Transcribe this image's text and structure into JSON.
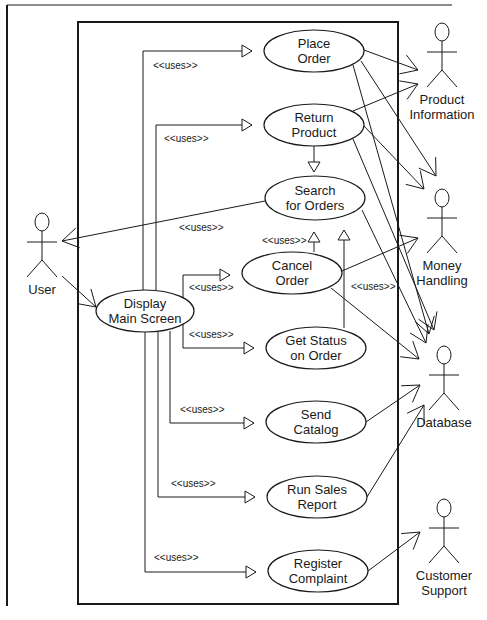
{
  "diagram": {
    "type": "UML use case diagram",
    "frame": {
      "top_line": {
        "x1": 7,
        "y": 5,
        "x2": 452
      },
      "left_line": {
        "x": 7,
        "y1": 5,
        "y2": 606
      }
    },
    "system_boundary": {
      "x": 78,
      "y": 22,
      "w": 320,
      "h": 582
    },
    "colors": {
      "stroke": "#1a1a1a",
      "background": "#ffffff"
    }
  },
  "use_cases": [
    {
      "id": "place_order",
      "lines": [
        "Place",
        "Order"
      ],
      "cx": 314,
      "cy": 51,
      "rx": 50,
      "ry": 21
    },
    {
      "id": "return_product",
      "lines": [
        "Return",
        "Product"
      ],
      "cx": 314,
      "cy": 125,
      "rx": 50,
      "ry": 21
    },
    {
      "id": "search_orders",
      "lines": [
        "Search",
        "for Orders"
      ],
      "cx": 315,
      "cy": 198,
      "rx": 50,
      "ry": 22
    },
    {
      "id": "cancel_order",
      "lines": [
        "Cancel",
        "Order"
      ],
      "cx": 292,
      "cy": 273,
      "rx": 50,
      "ry": 21
    },
    {
      "id": "display_main",
      "lines": [
        "Display",
        "Main Screen"
      ],
      "cx": 145,
      "cy": 311,
      "rx": 49,
      "ry": 21
    },
    {
      "id": "get_status",
      "lines": [
        "Get Status",
        "on Order"
      ],
      "cx": 316,
      "cy": 348,
      "rx": 50,
      "ry": 21
    },
    {
      "id": "send_catalog",
      "lines": [
        "Send",
        "Catalog"
      ],
      "cx": 316,
      "cy": 422,
      "rx": 50,
      "ry": 21
    },
    {
      "id": "run_sales_report",
      "lines": [
        "Run Sales",
        "Report"
      ],
      "cx": 317,
      "cy": 497,
      "rx": 50,
      "ry": 21
    },
    {
      "id": "register_complaint",
      "lines": [
        "Register",
        "Complaint"
      ],
      "cx": 318,
      "cy": 571,
      "rx": 50,
      "ry": 21
    }
  ],
  "actors": [
    {
      "id": "user",
      "lines": [
        "User"
      ],
      "x": 42,
      "head_y": 80,
      "y": 222
    },
    {
      "id": "product_information",
      "lines": [
        "Product",
        "Information"
      ],
      "x": 442,
      "y": 32
    },
    {
      "id": "money_handling",
      "lines": [
        "Money",
        "Handling"
      ],
      "x": 442,
      "y": 198
    },
    {
      "id": "database",
      "lines": [
        "Database"
      ],
      "x": 444,
      "y": 355
    },
    {
      "id": "customer_support",
      "lines": [
        "Customer",
        "Support"
      ],
      "x": 444,
      "y": 508
    }
  ],
  "stereotype_labels": [
    {
      "text": "<<uses>>",
      "x": 153,
      "y": 69
    },
    {
      "text": "<<uses>>",
      "x": 164,
      "y": 142
    },
    {
      "text": "<<uses>>",
      "x": 179,
      "y": 231
    },
    {
      "text": "<<uses>>",
      "x": 262,
      "y": 244
    },
    {
      "text": "<<uses>>",
      "x": 189,
      "y": 291
    },
    {
      "text": "<<uses>>",
      "x": 351,
      "y": 290
    },
    {
      "text": "<<uses>>",
      "x": 189,
      "y": 338
    },
    {
      "text": "<<uses>>",
      "x": 180,
      "y": 413
    },
    {
      "text": "<<uses>>",
      "x": 171,
      "y": 487
    },
    {
      "text": "<<uses>>",
      "x": 154,
      "y": 561
    }
  ],
  "uses_relations": [
    {
      "from": "display_main",
      "to": "place_order",
      "path": [
        [
          143,
          290
        ],
        [
          143,
          51
        ],
        [
          252,
          51
        ]
      ]
    },
    {
      "from": "display_main",
      "to": "return_product",
      "path": [
        [
          156,
          290
        ],
        [
          156,
          125
        ],
        [
          252,
          125
        ]
      ]
    },
    {
      "from": "display_main",
      "to": "cancel_order",
      "path": [
        [
          183,
          300
        ],
        [
          183,
          275
        ],
        [
          230,
          275
        ]
      ]
    },
    {
      "from": "display_main",
      "to": "get_status",
      "path": [
        [
          183,
          320
        ],
        [
          183,
          348
        ],
        [
          254,
          348
        ]
      ]
    },
    {
      "from": "display_main",
      "to": "send_catalog",
      "path": [
        [
          170,
          331
        ],
        [
          170,
          423
        ],
        [
          254,
          423
        ]
      ]
    },
    {
      "from": "display_main",
      "to": "run_sales_report",
      "path": [
        [
          158,
          332
        ],
        [
          158,
          497
        ],
        [
          255,
          497
        ]
      ]
    },
    {
      "from": "display_main",
      "to": "register_complaint",
      "path": [
        [
          145,
          332
        ],
        [
          145,
          572
        ],
        [
          256,
          572
        ]
      ]
    },
    {
      "from": "cancel_order",
      "to": "search_orders",
      "path": [
        [
          314,
          252
        ],
        [
          314,
          232
        ]
      ]
    },
    {
      "from": "get_status",
      "to": "search_orders",
      "path": [
        [
          344,
          328
        ],
        [
          344,
          230
        ]
      ]
    },
    {
      "from": "return_product",
      "to": "search_orders",
      "path": [
        [
          314,
          146
        ],
        [
          314,
          172
        ]
      ]
    }
  ],
  "associations": [
    {
      "from": "search_orders",
      "to": "user",
      "line": [
        [
          265,
          201
        ],
        [
          62,
          241
        ]
      ],
      "arrow_at": [
        62,
        241
      ]
    },
    {
      "from": "user",
      "to": "display_main",
      "line": [
        [
          62,
          276
        ],
        [
          96,
          307
        ]
      ],
      "arrow_at": [
        96,
        307
      ]
    },
    {
      "from": "place_order",
      "to": "product_information",
      "line": [
        [
          364,
          50
        ],
        [
          418,
          70
        ]
      ],
      "arrow_at": [
        418,
        70
      ]
    },
    {
      "from": "return_product",
      "to": "product_information",
      "line": [
        [
          353,
          111
        ],
        [
          418,
          84
        ]
      ],
      "arrow_at": [
        418,
        84
      ]
    },
    {
      "from": "place_order",
      "to": "money_handling",
      "line": [
        [
          361,
          61
        ],
        [
          436,
          176
        ]
      ],
      "arrow_at": [
        436,
        176
      ]
    },
    {
      "from": "return_product",
      "to": "money_handling",
      "line": [
        [
          364,
          126
        ],
        [
          424,
          189
        ]
      ],
      "arrow_at": [
        424,
        189
      ]
    },
    {
      "from": "cancel_order",
      "to": "money_handling",
      "line": [
        [
          342,
          271
        ],
        [
          418,
          238
        ]
      ],
      "arrow_at": [
        418,
        238
      ]
    },
    {
      "from": "place_order",
      "to": "database",
      "line": [
        [
          353,
          65
        ],
        [
          429,
          334
        ]
      ],
      "arrow_at": [
        429,
        334
      ]
    },
    {
      "from": "return_product",
      "to": "database",
      "line": [
        [
          353,
          139
        ],
        [
          434,
          330
        ]
      ],
      "arrow_at": [
        434,
        330
      ]
    },
    {
      "from": "search_orders",
      "to": "database",
      "line": [
        [
          362,
          210
        ],
        [
          426,
          343
        ]
      ],
      "arrow_at": [
        426,
        343
      ]
    },
    {
      "from": "cancel_order",
      "to": "database",
      "line": [
        [
          331,
          288
        ],
        [
          419,
          359
        ]
      ],
      "arrow_at": [
        419,
        359
      ]
    },
    {
      "from": "send_catalog",
      "to": "database",
      "line": [
        [
          366,
          422
        ],
        [
          420,
          385
        ]
      ],
      "arrow_at": [
        420,
        385
      ]
    },
    {
      "from": "run_sales_report",
      "to": "database",
      "line": [
        [
          367,
          497
        ],
        [
          424,
          405
        ]
      ],
      "arrow_at": [
        424,
        405
      ]
    },
    {
      "from": "register_complaint",
      "to": "customer_support",
      "line": [
        [
          368,
          571
        ],
        [
          420,
          532
        ]
      ],
      "arrow_at": [
        420,
        532
      ]
    }
  ]
}
